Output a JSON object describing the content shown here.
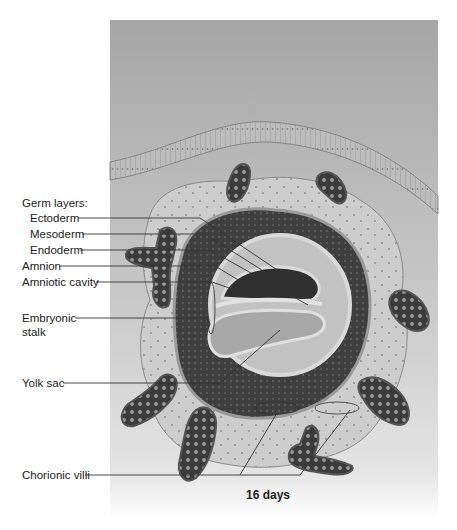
{
  "figure": {
    "caption": "16 days",
    "labels": {
      "germ_layers_heading": "Germ layers:",
      "ectoderm": "Ectoderm",
      "mesoderm": "Mesoderm",
      "endoderm": "Endoderm",
      "amnion": "Amnion",
      "amniotic_cavity": "Amniotic cavity",
      "embryonic_stalk_line1": "Embryonic",
      "embryonic_stalk_line2": "stalk",
      "yolk_sac": "Yolk sac",
      "chorionic_villi": "Chorionic villi"
    },
    "colors": {
      "background": "#ffffff",
      "panel_top": "#a9a9a9",
      "panel_bottom": "#e6e6e6",
      "tissue_light": "#cfcfcf",
      "tissue_dark": "#3a3a3a",
      "leader_line": "#333333"
    }
  }
}
